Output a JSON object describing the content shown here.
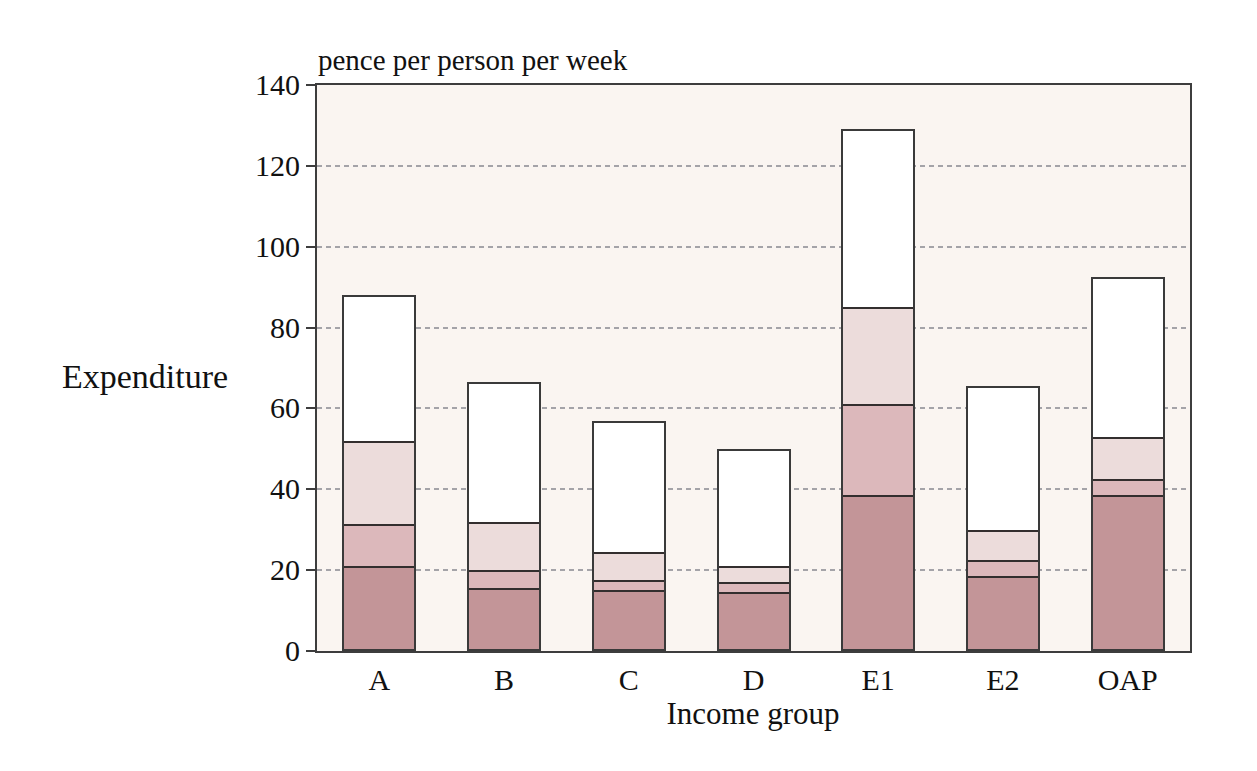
{
  "page": {
    "background_color": "#ffffff"
  },
  "labels": {
    "axis_units": "pence per person per week",
    "y_axis_title": "Expenditure",
    "x_axis_title": "Income group"
  },
  "colors": {
    "plot_background": "#faf5f1",
    "axis_line": "#3d3d3d",
    "gridline": "#95959b",
    "bar_outline": "#3a3a3a",
    "segment_boundary": "#332e2e"
  },
  "chart_data": {
    "type": "bar",
    "subtype": "stacked-bar",
    "title": "pence per person per week",
    "xlabel": "Income group",
    "ylabel": "Expenditure",
    "categories": [
      "A",
      "B",
      "C",
      "D",
      "E1",
      "E2",
      "OAP"
    ],
    "ylim": [
      0,
      140
    ],
    "yticks": [
      0,
      20,
      40,
      60,
      80,
      100,
      120,
      140
    ],
    "grid": "horizontal dashed gridlines at 20,40,60,80,100,120; hidden behind bars",
    "legend": "none visible",
    "series": [
      {
        "name": "segment-1-bottom-dark-pink",
        "color": "#c39598",
        "values": [
          20.5,
          15.0,
          14.5,
          14.0,
          38.0,
          18.0,
          38.0
        ]
      },
      {
        "name": "segment-2-medium-pink",
        "color": "#dcb8bb",
        "values": [
          10.5,
          4.5,
          2.5,
          2.5,
          22.5,
          4.0,
          4.0
        ]
      },
      {
        "name": "segment-3-light-pink",
        "color": "#ecdcdb",
        "values": [
          20.5,
          12.0,
          7.0,
          4.0,
          24.0,
          7.5,
          10.5
        ]
      },
      {
        "name": "segment-4-top-white",
        "color": "#ffffff",
        "values": [
          36.5,
          35.0,
          33.0,
          29.5,
          44.5,
          36.0,
          40.0
        ]
      }
    ],
    "cumulative_boundaries": {
      "A": [
        20.5,
        31.0,
        51.5,
        88.0
      ],
      "B": [
        15.0,
        19.5,
        31.5,
        66.5
      ],
      "C": [
        14.5,
        17.0,
        24.0,
        57.0
      ],
      "D": [
        14.0,
        16.5,
        20.5,
        50.0
      ],
      "E1": [
        38.0,
        60.5,
        84.5,
        129.0
      ],
      "E2": [
        18.0,
        22.0,
        29.5,
        65.5
      ],
      "OAP": [
        38.0,
        42.0,
        52.5,
        92.5
      ]
    },
    "totals": [
      88.0,
      66.5,
      57.0,
      50.0,
      129.0,
      65.5,
      92.5
    ]
  }
}
